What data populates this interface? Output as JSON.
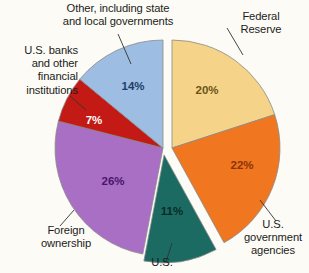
{
  "chart_data": {
    "type": "pie",
    "title": "",
    "subtitle": "",
    "xlabel": "",
    "ylabel": "",
    "legend_position": "labels-with-leader-lines",
    "grid": false,
    "units": "percent",
    "categories": [
      "Federal Reserve",
      "U.S. government agencies",
      "U.S.",
      "Foreign ownership",
      "U.S. banks and other financial institutions",
      "Other, including state and local governments"
    ],
    "values": [
      20,
      22,
      11,
      26,
      7,
      14
    ],
    "slices": [
      {
        "key": "federal-reserve",
        "label": "Federal\nReserve",
        "value": 20,
        "value_text": "20%",
        "color": "#f5d388",
        "value_color": "#6b5418",
        "start_angle": 0,
        "end_angle": 72,
        "explode": 9,
        "explode_angle": 90,
        "value_x": 207,
        "value_y": 91,
        "leader": {
          "x1": 243,
          "y1": 55,
          "x2": 227,
          "y2": 28
        }
      },
      {
        "key": "us-government-agencies",
        "label": "U.S.\ngovernment\nagencies",
        "value": 22,
        "value_text": "22%",
        "color": "#f0761f",
        "value_color": "#8a3408",
        "start_angle": 72,
        "end_angle": 151.2,
        "explode": 9,
        "explode_angle": 90,
        "value_x": 242,
        "value_y": 166,
        "leader": {
          "x1": 260,
          "y1": 200,
          "x2": 276,
          "y2": 221
        }
      },
      {
        "key": "us-households",
        "label": "U.S.",
        "value": 11,
        "value_text": "11%",
        "color": "#1b6b62",
        "value_color": "#0a2b27",
        "start_angle": 151.2,
        "end_angle": 190.8,
        "explode": 7,
        "explode_angle": 171,
        "value_x": 172,
        "value_y": 212,
        "leader": {
          "x1": 172,
          "y1": 243,
          "x2": 166,
          "y2": 262
        }
      },
      {
        "key": "foreign-ownership",
        "label": "Foreign\nownership",
        "value": 26,
        "value_text": "26%",
        "color": "#a96fc4",
        "value_color": "#48156b",
        "start_angle": 190.8,
        "end_angle": 284.4,
        "explode": 0,
        "explode_angle": 0,
        "value_x": 113,
        "value_y": 182,
        "leader": {
          "x1": 74,
          "y1": 210,
          "x2": 60,
          "y2": 226
        }
      },
      {
        "key": "us-banks",
        "label": "U.S. banks\nand other\nfinancial\ninstitutions",
        "value": 7,
        "value_text": "7%",
        "color": "#c41a16",
        "value_color": "#ffffff",
        "start_angle": 284.4,
        "end_angle": 309.6,
        "explode": 0,
        "explode_angle": 0,
        "value_x": 94,
        "value_y": 121,
        "leader": {
          "x1": 86,
          "y1": 110,
          "x2": 70,
          "y2": 96
        }
      },
      {
        "key": "other-state-local",
        "label": "Other, including state\nand local governments",
        "value": 14,
        "value_text": "14%",
        "color": "#9dbde2",
        "value_color": "#1c3d6b",
        "start_angle": 309.6,
        "end_angle": 360,
        "explode": 0,
        "explode_angle": 0,
        "value_x": 133,
        "value_y": 87,
        "leader": {
          "x1": 131,
          "y1": 64,
          "x2": 118,
          "y2": 34
        }
      }
    ],
    "geometry": {
      "center_x": 163,
      "center_y": 148,
      "radius": 108,
      "stroke": "#8a8a8a",
      "stroke_width": 0.8,
      "background": "#fcfbf6"
    }
  }
}
